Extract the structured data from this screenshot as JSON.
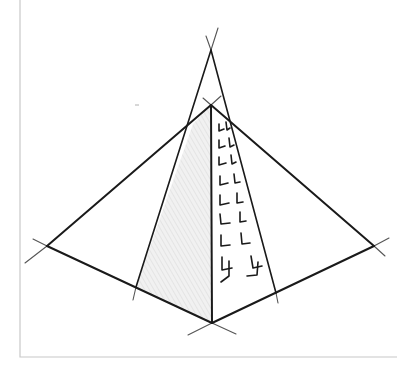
{
  "figure": {
    "width": 402,
    "height": 366,
    "background": "#ffffff",
    "frame": {
      "color": "#c8c8c8",
      "left_x": 20,
      "top_y": 0,
      "right_x": 397,
      "bottom_y": 357
    },
    "stroke_color": "#1a1a1a",
    "construction_color": "#555555",
    "shading_color": "#e4e4e4",
    "points": {
      "vanishing_top": [
        211,
        50
      ],
      "apex": [
        211,
        105
      ],
      "bottom": [
        212,
        323
      ],
      "left": [
        47,
        246
      ],
      "right": [
        374,
        246
      ],
      "inner_left": [
        136,
        287
      ],
      "inner_right": [
        276,
        293
      ]
    },
    "edges": [
      {
        "name": "apex-left",
        "from": [
          211,
          105
        ],
        "to": [
          47,
          246
        ]
      },
      {
        "name": "apex-right",
        "from": [
          211,
          105
        ],
        "to": [
          374,
          246
        ]
      },
      {
        "name": "left-bottom",
        "from": [
          47,
          246
        ],
        "to": [
          212,
          323
        ]
      },
      {
        "name": "bottom-right",
        "from": [
          212,
          323
        ],
        "to": [
          374,
          246
        ]
      },
      {
        "name": "apex-bottom",
        "from": [
          211,
          105
        ],
        "to": [
          212,
          323
        ]
      },
      {
        "name": "vanish-inner-left",
        "from": [
          211,
          50
        ],
        "to": [
          136,
          287
        ]
      },
      {
        "name": "vanish-inner-right",
        "from": [
          211,
          50
        ],
        "to": [
          276,
          293
        ]
      }
    ],
    "construction_lines": [
      {
        "name": "ext-vl-top",
        "from": [
          211,
          50
        ],
        "to": [
          206,
          36
        ]
      },
      {
        "name": "ext-vr-top",
        "from": [
          211,
          50
        ],
        "to": [
          218,
          28
        ]
      },
      {
        "name": "ext-apex-nw",
        "from": [
          211,
          105
        ],
        "to": [
          203,
          98
        ]
      },
      {
        "name": "ext-apex-ne",
        "from": [
          211,
          105
        ],
        "to": [
          221,
          96
        ]
      },
      {
        "name": "ext-left-up",
        "from": [
          47,
          246
        ],
        "to": [
          33,
          239
        ]
      },
      {
        "name": "ext-left-down",
        "from": [
          47,
          246
        ],
        "to": [
          25,
          263
        ]
      },
      {
        "name": "ext-right-up",
        "from": [
          374,
          246
        ],
        "to": [
          389,
          238
        ]
      },
      {
        "name": "ext-right-down",
        "from": [
          374,
          246
        ],
        "to": [
          385,
          256
        ]
      },
      {
        "name": "ext-bottom-left",
        "from": [
          212,
          323
        ],
        "to": [
          188,
          335
        ]
      },
      {
        "name": "ext-bottom-right",
        "from": [
          212,
          323
        ],
        "to": [
          236,
          334
        ]
      },
      {
        "name": "ext-inner-left",
        "from": [
          136,
          287
        ],
        "to": [
          133,
          300
        ]
      },
      {
        "name": "ext-inner-right",
        "from": [
          276,
          293
        ],
        "to": [
          278,
          303
        ]
      }
    ],
    "shaded_face": [
      [
        193,
        124
      ],
      [
        211,
        105
      ],
      [
        212,
        323
      ],
      [
        136,
        287
      ]
    ],
    "brick_marks": [
      [
        [
          219,
          124
        ],
        [
          219,
          131
        ],
        [
          224,
          129
        ]
      ],
      [
        [
          226,
          122
        ],
        [
          227,
          130
        ],
        [
          230,
          128
        ]
      ],
      [
        [
          219,
          140
        ],
        [
          219,
          148
        ],
        [
          225,
          146
        ]
      ],
      [
        [
          229,
          138
        ],
        [
          230,
          147
        ],
        [
          234,
          145
        ]
      ],
      [
        [
          219,
          157
        ],
        [
          219,
          165
        ],
        [
          226,
          163
        ]
      ],
      [
        [
          231,
          155
        ],
        [
          232,
          164
        ],
        [
          236,
          162
        ]
      ],
      [
        [
          220,
          176
        ],
        [
          220,
          185
        ],
        [
          228,
          183
        ]
      ],
      [
        [
          234,
          174
        ],
        [
          235,
          183
        ],
        [
          240,
          182
        ]
      ],
      [
        [
          220,
          195
        ],
        [
          220,
          205
        ],
        [
          229,
          203
        ]
      ],
      [
        [
          237,
          193
        ],
        [
          237,
          203
        ],
        [
          243,
          202
        ]
      ],
      [
        [
          220,
          214
        ],
        [
          221,
          224
        ],
        [
          230,
          223
        ]
      ],
      [
        [
          240,
          212
        ],
        [
          240,
          222
        ],
        [
          246,
          221
        ]
      ],
      [
        [
          221,
          235
        ],
        [
          221,
          246
        ],
        [
          230,
          245
        ]
      ],
      [
        [
          241,
          233
        ],
        [
          242,
          244
        ],
        [
          250,
          243
        ]
      ],
      [
        [
          222,
          257
        ],
        [
          222,
          270
        ],
        [
          232,
          268
        ]
      ],
      [
        [
          251,
          256
        ],
        [
          253,
          268
        ],
        [
          262,
          266
        ]
      ],
      [
        [
          229,
          261
        ],
        [
          229,
          276
        ],
        [
          221,
          282
        ]
      ],
      [
        [
          258,
          262
        ],
        [
          257,
          275
        ],
        [
          247,
          276
        ]
      ]
    ],
    "stray_mark": {
      "from": [
        135,
        105
      ],
      "to": [
        139,
        105
      ]
    }
  }
}
